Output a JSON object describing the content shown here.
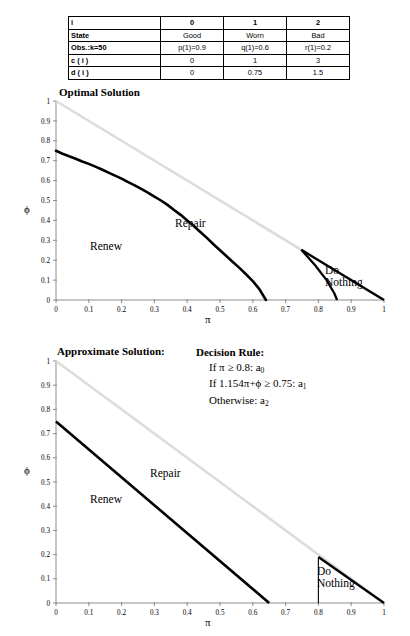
{
  "table": {
    "columns": [
      "i",
      "0",
      "1",
      "2"
    ],
    "rows": [
      {
        "label": "State",
        "cells": [
          "Good",
          "Worn",
          "Bad"
        ]
      },
      {
        "label_a": "Obs.:",
        "label_b": "k=50",
        "cells": [
          "p(1)=0.9",
          "q(1)=0.6",
          "r(1)=0.2"
        ]
      },
      {
        "label": "c ( i )",
        "cells": [
          "0",
          "1",
          "3"
        ]
      },
      {
        "label": "d ( i )",
        "cells": [
          "0",
          "0.75",
          "1.5"
        ]
      }
    ]
  },
  "charts": [
    {
      "title": "Optimal Solution",
      "xlabel": "π",
      "ylabel": "ϕ",
      "regions": [
        {
          "name": "Renew",
          "x": 0.18,
          "y": 0.3
        },
        {
          "name": "Repair",
          "x": 0.45,
          "y": 0.42
        },
        {
          "name": "Do Nothing",
          "x": 0.86,
          "y": 0.1
        }
      ]
    },
    {
      "title": "Approximate Solution:",
      "xlabel": "π",
      "ylabel": "ϕ",
      "regions": [
        {
          "name": "Renew",
          "x": 0.18,
          "y": 0.23
        },
        {
          "name": "Repair",
          "x": 0.38,
          "y": 0.46
        },
        {
          "name": "Do Nothing",
          "x": 0.82,
          "y": 0.08
        }
      ]
    }
  ],
  "decision_rule": {
    "heading": "Decision Rule:",
    "line1_pre": "If π ≥ 0.8: a",
    "line1_sub": "0",
    "line2_pre": "If 1.154π+ϕ ≥ 0.75: a",
    "line2_sub": "1",
    "line3_pre": "Otherwise: a",
    "line3_sub": "2"
  },
  "axis_ticks": {
    "x": [
      "0",
      "0.1",
      "0.2",
      "0.3",
      "0.4",
      "0.5",
      "0.6",
      "0.7",
      "0.8",
      "0.9",
      "1"
    ],
    "y": [
      "0",
      "0.1",
      "0.2",
      "0.3",
      "0.4",
      "0.5",
      "0.6",
      "0.7",
      "0.8",
      "0.9",
      "1"
    ]
  },
  "colors": {
    "axis": "#8d8d8d",
    "boundary": "#000000",
    "faint_line": "#dcdcdc"
  },
  "chart_data": [
    {
      "type": "line",
      "title": "Optimal Solution",
      "xlabel": "π",
      "ylabel": "ϕ",
      "xlim": [
        0,
        1
      ],
      "ylim": [
        0,
        1
      ],
      "grid": false,
      "legend": "none",
      "annotations": [
        "Renew",
        "Repair",
        "Do Nothing"
      ],
      "series": [
        {
          "name": "simplex-boundary",
          "style": "faint-diagonal",
          "color": "#dcdcdc",
          "x": [
            0,
            1
          ],
          "y": [
            1,
            0
          ]
        },
        {
          "name": "renew-repair-boundary",
          "style": "thick-stepped",
          "color": "#000000",
          "x": [
            0.0,
            0.02,
            0.04,
            0.06,
            0.08,
            0.1,
            0.12,
            0.14,
            0.16,
            0.18,
            0.2,
            0.22,
            0.24,
            0.26,
            0.28,
            0.3,
            0.32,
            0.34,
            0.36,
            0.38,
            0.4,
            0.42,
            0.44,
            0.46,
            0.48,
            0.5,
            0.52,
            0.54,
            0.56,
            0.58,
            0.6,
            0.62,
            0.64
          ],
          "y": [
            0.75,
            0.735,
            0.722,
            0.71,
            0.696,
            0.684,
            0.67,
            0.656,
            0.64,
            0.625,
            0.61,
            0.592,
            0.576,
            0.558,
            0.54,
            0.52,
            0.5,
            0.478,
            0.452,
            0.428,
            0.4,
            0.372,
            0.342,
            0.312,
            0.28,
            0.25,
            0.22,
            0.19,
            0.16,
            0.128,
            0.095,
            0.055,
            0.0
          ]
        },
        {
          "name": "do-nothing-upper",
          "style": "thick",
          "color": "#000000",
          "x": [
            0.748,
            1.0
          ],
          "y": [
            0.252,
            0.0
          ]
        },
        {
          "name": "do-nothing-lower",
          "style": "thick",
          "color": "#000000",
          "x": [
            0.748,
            0.79,
            0.825,
            0.848,
            0.857
          ],
          "y": [
            0.252,
            0.175,
            0.1,
            0.035,
            0.0
          ]
        }
      ]
    },
    {
      "type": "line",
      "title": "Approximate Solution:",
      "xlabel": "π",
      "ylabel": "ϕ",
      "xlim": [
        0,
        1
      ],
      "ylim": [
        0,
        1
      ],
      "grid": false,
      "legend": "none",
      "annotations": [
        "Renew",
        "Repair",
        "Do Nothing"
      ],
      "series": [
        {
          "name": "simplex-boundary",
          "style": "faint-diagonal",
          "color": "#dcdcdc",
          "x": [
            0,
            1
          ],
          "y": [
            1,
            0
          ]
        },
        {
          "name": "renew-repair-boundary",
          "style": "thick-straight",
          "color": "#000000",
          "x": [
            0.0,
            0.65
          ],
          "y": [
            0.75,
            0.0
          ]
        },
        {
          "name": "do-nothing-vertical",
          "style": "thin",
          "color": "#000000",
          "x": [
            0.8,
            0.8
          ],
          "y": [
            0.0,
            0.19
          ]
        },
        {
          "name": "do-nothing-hypotenuse",
          "style": "thick",
          "color": "#000000",
          "x": [
            0.8,
            1.0
          ],
          "y": [
            0.19,
            0.0
          ]
        }
      ]
    }
  ]
}
